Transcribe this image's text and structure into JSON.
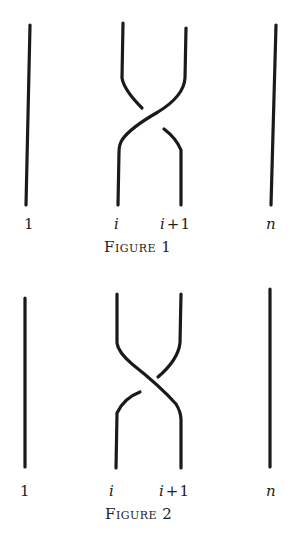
{
  "figures": [
    {
      "caption": "Figure 1",
      "caption_first": "F",
      "caption_rest": "IGURE",
      "caption_num": "1",
      "labels": {
        "first": "1",
        "i": "i",
        "i_plus_1": "i + 1",
        "n": "n"
      },
      "crossing": "strand i+1 passes over strand i (positive crossing)"
    },
    {
      "caption": "Figure 2",
      "caption_first": "F",
      "caption_rest": "IGURE",
      "caption_num": "2",
      "labels": {
        "first": "1",
        "i": "i",
        "i_plus_1": "i + 1",
        "n": "n"
      },
      "crossing": "strand i passes over strand i+1 (negative crossing)"
    }
  ],
  "colors": {
    "ink": "#1a1a1a",
    "background": "#ffffff"
  }
}
